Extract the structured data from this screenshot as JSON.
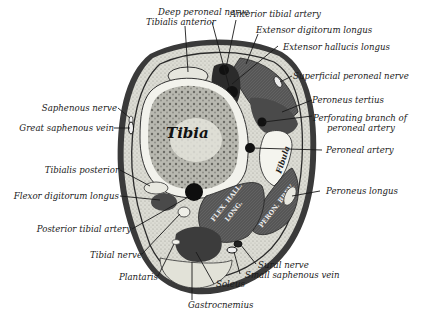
{
  "diagram": {
    "inner_labels": {
      "tibia": "Tibia",
      "fibula": "Fibula",
      "flex_hall_long_1": "FLEX. HALL.",
      "flex_hall_long_2": "LONG.",
      "peron_brev": "PERON. BREV."
    },
    "labels": {
      "deep_peroneal_nerve": "Deep peroneal nerve",
      "tibialis_anterior": "Tibialis anterior",
      "anterior_tibial_artery": "Anterior tibial artery",
      "extensor_digitorum_longus": "Extensor digitorum longus",
      "extensor_hallucis_longus": "Extensor hallucis longus",
      "superficial_peroneal_nerve": "Superficial peroneal nerve",
      "peroneus_tertius": "Peroneus tertius",
      "perforating_branch_1": "Perforating branch of",
      "perforating_branch_2": "peroneal artery",
      "peroneal_artery": "Peroneal artery",
      "peroneus_longus": "Peroneus longus",
      "saphenous_nerve": "Saphenous nerve",
      "great_saphenous_vein": "Great saphenous vein",
      "tibialis_posterior": "Tibialis posterior",
      "flexor_digitorum_longus": "Flexor digitorum longus",
      "posterior_tibial_artery": "Posterior tibial artery",
      "tibial_nerve": "Tibial nerve",
      "plantaris": "Plantaris",
      "soleus": "Soleus",
      "gastrocnemius": "Gastrocnemius",
      "sural_nerve": "Sural nerve",
      "small_saphenous_vein": "Small saphenous vein"
    },
    "colors": {
      "ink": "#1a1a1a",
      "skin": "#3a3a3a",
      "fat": "#d9d9d0",
      "muscle_dark": "#4a4a4a",
      "muscle_mid": "#6e6e6e",
      "bone_cortex": "#f0f0ea",
      "bone_marrow": "#9a9a94"
    }
  }
}
